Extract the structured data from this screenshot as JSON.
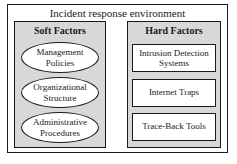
{
  "diagram": {
    "title": "Incident response environment",
    "soft_factors": {
      "title": "Soft Factors",
      "items": [
        "Management Policies",
        "Organizational Structure",
        "Administrative Procedures"
      ]
    },
    "hard_factors": {
      "title": "Hard Factors",
      "items": [
        "Intrusion Detection Systems",
        "Internet Traps",
        "Trace-Back Tools"
      ]
    },
    "colors": {
      "panel_background": "#d8d8d8",
      "node_background": "#ffffff",
      "border": "#1a1a1a"
    }
  }
}
